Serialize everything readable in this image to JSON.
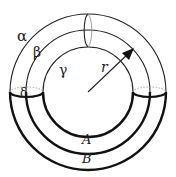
{
  "diagram": {
    "labels": {
      "alpha": "α",
      "beta": "β",
      "gamma": "γ",
      "delta": "δ",
      "radius": "r",
      "region_a": "A",
      "region_b": "B"
    },
    "colors": {
      "line": "#222222",
      "dashed": "#9a9a9a",
      "background": "#ffffff"
    }
  }
}
